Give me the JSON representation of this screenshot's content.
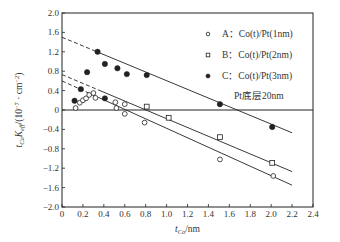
{
  "chart_data": {
    "type": "scatter",
    "title": "",
    "xlabel": "t_Co/nm",
    "xlabel_parts": {
      "var": "t",
      "sub": "Co",
      "unit": "/nm"
    },
    "ylabel": "t_Co K_eff/(10^-7 · cm^-2)",
    "ylabel_parts": {
      "var": "t",
      "sub1": "Co",
      "var2": "K",
      "sub2": "eff",
      "unit_open": "/(10",
      "exp": "−7",
      "unit_mid": " · cm",
      "exp2": "−2",
      "unit_close": ")"
    },
    "xlim": [
      0,
      2.4
    ],
    "ylim": [
      -2.0,
      2.0
    ],
    "xticks": [
      0,
      0.2,
      0.4,
      0.6,
      0.8,
      1.0,
      1.2,
      1.4,
      1.6,
      1.8,
      2.0,
      2.2,
      2.4
    ],
    "xtick_labels": [
      "0",
      "0.2",
      "0.4",
      "0.6",
      "0.8",
      "1.0",
      "1.2",
      "1.4",
      "1.6",
      "1.8",
      "2.0",
      "2.2",
      "2.4"
    ],
    "yticks": [
      2.0,
      1.6,
      1.2,
      0.8,
      0.4,
      0,
      -0.4,
      -0.8,
      -1.2,
      -1.6,
      -2.0
    ],
    "ytick_labels": [
      "2.0",
      "1.6",
      "1.2",
      "0.8",
      "0.4",
      "0",
      "−0.4",
      "−0.8",
      "−1.2",
      "−1.6",
      "−2.0"
    ],
    "grid": false,
    "zero_line": true,
    "legend_position": "top-right",
    "annotation": "Pt底层20nm",
    "series": [
      {
        "name": "A: Co(t)/Pt(1nm)",
        "label_prefix": "A：",
        "label_text": "Co(t)/Pt(1nm)",
        "marker": "open-circle",
        "points": [
          [
            0.13,
            0.04
          ],
          [
            0.17,
            0.15
          ],
          [
            0.2,
            0.2
          ],
          [
            0.23,
            0.24
          ],
          [
            0.26,
            0.31
          ],
          [
            0.3,
            0.35
          ],
          [
            0.32,
            0.25
          ],
          [
            0.51,
            0.16
          ],
          [
            0.52,
            0.04
          ],
          [
            0.6,
            0.12
          ],
          [
            0.6,
            -0.08
          ],
          [
            0.79,
            -0.26
          ],
          [
            1.51,
            -1.02
          ],
          [
            2.02,
            -1.36
          ]
        ],
        "fit_line": {
          "x": [
            0,
            2.2
          ],
          "y": [
            0.6,
            -1.55
          ],
          "dashed_until_x": 0.35
        }
      },
      {
        "name": "B: Co(t)/Pt(2nm)",
        "label_prefix": "B：",
        "label_text": "Co(t)/Pt(2nm)",
        "marker": "open-square",
        "points": [
          [
            0.81,
            0.07
          ],
          [
            1.02,
            -0.16
          ],
          [
            1.51,
            -0.56
          ],
          [
            2.01,
            -1.09
          ]
        ],
        "fit_line": {
          "x": [
            0,
            2.2
          ],
          "y": [
            0.73,
            -1.27
          ],
          "dashed_until_x": 0.35
        }
      },
      {
        "name": "C: Co(t)/Pt(3nm)",
        "label_prefix": "C：",
        "label_text": "Co(t)/Pt(3nm)",
        "marker": "filled-circle",
        "points": [
          [
            0.12,
            0.19
          ],
          [
            0.18,
            0.43
          ],
          [
            0.24,
            0.78
          ],
          [
            0.34,
            1.2
          ],
          [
            0.41,
            0.95
          ],
          [
            0.41,
            0.24
          ],
          [
            0.53,
            0.86
          ],
          [
            0.62,
            0.74
          ],
          [
            0.81,
            0.72
          ],
          [
            1.51,
            0.12
          ],
          [
            2.01,
            -0.35
          ]
        ],
        "fit_line": {
          "x": [
            0,
            2.2
          ],
          "y": [
            1.5,
            -0.47
          ],
          "dashed_until_x": 0.33
        }
      }
    ]
  },
  "colors": {
    "ink": "#222222",
    "text": "#333333",
    "background": "#ffffff"
  }
}
